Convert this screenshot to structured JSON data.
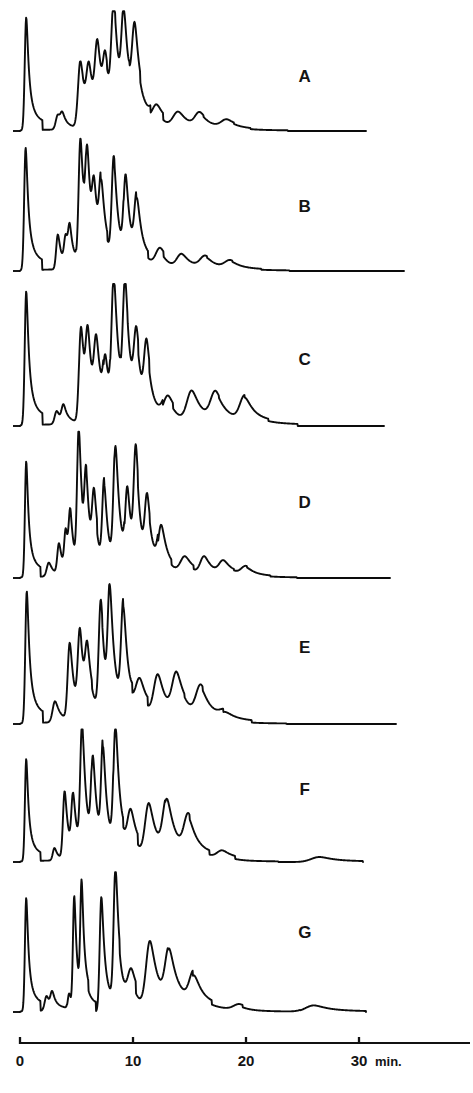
{
  "figure": {
    "background_color": "#ffffff",
    "trace_color": "#0c0c0c",
    "axis_color": "#111111"
  },
  "axis": {
    "label": "min.",
    "tick_labels": [
      "0",
      "10",
      "20",
      "30"
    ],
    "tick_values": [
      0,
      10,
      20,
      30
    ],
    "x_start_px": 20,
    "x_per_min_px": 11.3,
    "axis_y_px": 1043,
    "label_y_px": 1066
  },
  "panels": [
    {
      "label": "A",
      "label_x": 305,
      "label_y": 82,
      "baseline_y": 131,
      "top_y": 18,
      "end_x": 366
    },
    {
      "label": "B",
      "label_x": 305,
      "label_y": 212,
      "baseline_y": 271,
      "top_y": 146,
      "end_x": 404
    },
    {
      "label": "C",
      "label_x": 305,
      "label_y": 365,
      "baseline_y": 426,
      "top_y": 292,
      "end_x": 384
    },
    {
      "label": "D",
      "label_x": 305,
      "label_y": 508,
      "baseline_y": 578,
      "top_y": 440,
      "end_x": 390
    },
    {
      "label": "E",
      "label_x": 305,
      "label_y": 653,
      "baseline_y": 724,
      "top_y": 592,
      "end_x": 396
    },
    {
      "label": "F",
      "label_x": 305,
      "label_y": 795,
      "baseline_y": 862,
      "top_y": 737,
      "end_x": 363
    },
    {
      "label": "G",
      "label_x": 305,
      "label_y": 938,
      "baseline_y": 1012,
      "top_y": 880,
      "end_x": 366
    }
  ],
  "chart_data": {
    "type": "line",
    "xlabel": "min.",
    "ylabel": "Detector response",
    "xlim": [
      0,
      34
    ],
    "ylim": [
      0,
      1
    ],
    "grid": false,
    "legend": "none",
    "x_ticks": [
      0,
      10,
      20,
      30
    ],
    "x_tick_labels": [
      "0",
      "10",
      "20",
      "30"
    ],
    "note": "Seven stacked chromatogram traces, each a solvent front peak near t=0 followed by a resolved peak series and a flat tail. Peak values are normalized 0-1 relative to each panel's own full height.",
    "series": [
      {
        "name": "A",
        "peaks": [
          {
            "t": 0.55,
            "h": 1.0,
            "w": 0.16
          },
          {
            "t": 3.35,
            "h": 0.13,
            "w": 0.22
          },
          {
            "t": 3.75,
            "h": 0.1,
            "w": 0.2
          },
          {
            "t": 5.35,
            "h": 0.6,
            "w": 0.26
          },
          {
            "t": 6.1,
            "h": 0.43,
            "w": 0.26
          },
          {
            "t": 6.85,
            "h": 0.6,
            "w": 0.26
          },
          {
            "t": 7.55,
            "h": 0.4,
            "w": 0.24
          },
          {
            "t": 8.3,
            "h": 0.93,
            "w": 0.26
          },
          {
            "t": 9.2,
            "h": 0.8,
            "w": 0.26
          },
          {
            "t": 10.15,
            "h": 0.68,
            "w": 0.28
          },
          {
            "t": 12.1,
            "h": 0.16,
            "w": 0.46
          },
          {
            "t": 14.0,
            "h": 0.14,
            "w": 0.55
          },
          {
            "t": 15.9,
            "h": 0.12,
            "w": 0.5
          },
          {
            "t": 18.3,
            "h": 0.07,
            "w": 0.6
          }
        ]
      },
      {
        "name": "B",
        "peaks": [
          {
            "t": 0.5,
            "h": 0.98,
            "w": 0.16
          },
          {
            "t": 3.35,
            "h": 0.28,
            "w": 0.18
          },
          {
            "t": 4.05,
            "h": 0.22,
            "w": 0.18
          },
          {
            "t": 4.4,
            "h": 0.24,
            "w": 0.16
          },
          {
            "t": 5.35,
            "h": 1.0,
            "w": 0.2
          },
          {
            "t": 5.95,
            "h": 0.72,
            "w": 0.2
          },
          {
            "t": 6.55,
            "h": 0.42,
            "w": 0.2
          },
          {
            "t": 7.2,
            "h": 0.53,
            "w": 0.22
          },
          {
            "t": 8.3,
            "h": 0.8,
            "w": 0.22
          },
          {
            "t": 9.35,
            "h": 0.64,
            "w": 0.22
          },
          {
            "t": 10.35,
            "h": 0.47,
            "w": 0.26
          },
          {
            "t": 12.4,
            "h": 0.14,
            "w": 0.46
          },
          {
            "t": 14.3,
            "h": 0.11,
            "w": 0.5
          },
          {
            "t": 16.4,
            "h": 0.09,
            "w": 0.55
          },
          {
            "t": 18.6,
            "h": 0.06,
            "w": 0.58
          }
        ]
      },
      {
        "name": "C",
        "peaks": [
          {
            "t": 0.55,
            "h": 1.0,
            "w": 0.16
          },
          {
            "t": 3.25,
            "h": 0.1,
            "w": 0.22
          },
          {
            "t": 3.85,
            "h": 0.12,
            "w": 0.2
          },
          {
            "t": 5.4,
            "h": 0.72,
            "w": 0.22
          },
          {
            "t": 6.0,
            "h": 0.52,
            "w": 0.22
          },
          {
            "t": 6.75,
            "h": 0.46,
            "w": 0.24
          },
          {
            "t": 7.55,
            "h": 0.36,
            "w": 0.22
          },
          {
            "t": 8.3,
            "h": 0.98,
            "w": 0.24
          },
          {
            "t": 9.3,
            "h": 0.88,
            "w": 0.24
          },
          {
            "t": 10.3,
            "h": 0.48,
            "w": 0.26
          },
          {
            "t": 11.2,
            "h": 0.45,
            "w": 0.26
          },
          {
            "t": 13.1,
            "h": 0.18,
            "w": 0.5
          },
          {
            "t": 15.2,
            "h": 0.23,
            "w": 0.52
          },
          {
            "t": 17.3,
            "h": 0.2,
            "w": 0.52
          },
          {
            "t": 19.9,
            "h": 0.18,
            "w": 0.52
          }
        ]
      },
      {
        "name": "D",
        "peaks": [
          {
            "t": 0.55,
            "h": 0.84,
            "w": 0.14
          },
          {
            "t": 2.55,
            "h": 0.1,
            "w": 0.22
          },
          {
            "t": 3.45,
            "h": 0.22,
            "w": 0.18
          },
          {
            "t": 4.05,
            "h": 0.28,
            "w": 0.16
          },
          {
            "t": 4.45,
            "h": 0.36,
            "w": 0.16
          },
          {
            "t": 5.2,
            "h": 1.0,
            "w": 0.18
          },
          {
            "t": 5.85,
            "h": 0.55,
            "w": 0.18
          },
          {
            "t": 6.55,
            "h": 0.43,
            "w": 0.2
          },
          {
            "t": 7.45,
            "h": 0.6,
            "w": 0.2
          },
          {
            "t": 8.45,
            "h": 0.86,
            "w": 0.22
          },
          {
            "t": 9.5,
            "h": 0.52,
            "w": 0.22
          },
          {
            "t": 10.25,
            "h": 0.76,
            "w": 0.22
          },
          {
            "t": 11.25,
            "h": 0.43,
            "w": 0.24
          },
          {
            "t": 12.5,
            "h": 0.32,
            "w": 0.32
          },
          {
            "t": 14.6,
            "h": 0.12,
            "w": 0.48
          },
          {
            "t": 16.3,
            "h": 0.13,
            "w": 0.42
          },
          {
            "t": 18.0,
            "h": 0.09,
            "w": 0.46
          },
          {
            "t": 20.0,
            "h": 0.06,
            "w": 0.5
          }
        ]
      },
      {
        "name": "E",
        "peaks": [
          {
            "t": 0.6,
            "h": 1.0,
            "w": 0.16
          },
          {
            "t": 3.1,
            "h": 0.16,
            "w": 0.26
          },
          {
            "t": 4.4,
            "h": 0.58,
            "w": 0.22
          },
          {
            "t": 5.3,
            "h": 0.59,
            "w": 0.22
          },
          {
            "t": 5.95,
            "h": 0.39,
            "w": 0.22
          },
          {
            "t": 7.15,
            "h": 0.83,
            "w": 0.22
          },
          {
            "t": 7.95,
            "h": 0.86,
            "w": 0.22
          },
          {
            "t": 9.15,
            "h": 0.76,
            "w": 0.24
          },
          {
            "t": 10.6,
            "h": 0.25,
            "w": 0.44
          },
          {
            "t": 12.2,
            "h": 0.32,
            "w": 0.44
          },
          {
            "t": 13.85,
            "h": 0.3,
            "w": 0.46
          },
          {
            "t": 16.0,
            "h": 0.22,
            "w": 0.5
          },
          {
            "t": 18.2,
            "h": 0.05,
            "w": 0.6
          }
        ]
      },
      {
        "name": "F",
        "peaks": [
          {
            "t": 0.55,
            "h": 0.82,
            "w": 0.14
          },
          {
            "t": 3.05,
            "h": 0.1,
            "w": 0.18
          },
          {
            "t": 3.95,
            "h": 0.54,
            "w": 0.18
          },
          {
            "t": 4.7,
            "h": 0.44,
            "w": 0.18
          },
          {
            "t": 5.5,
            "h": 1.0,
            "w": 0.2
          },
          {
            "t": 6.45,
            "h": 0.68,
            "w": 0.2
          },
          {
            "t": 7.35,
            "h": 0.8,
            "w": 0.2
          },
          {
            "t": 8.45,
            "h": 0.98,
            "w": 0.22
          },
          {
            "t": 9.8,
            "h": 0.3,
            "w": 0.34
          },
          {
            "t": 11.4,
            "h": 0.42,
            "w": 0.4
          },
          {
            "t": 13.0,
            "h": 0.42,
            "w": 0.42
          },
          {
            "t": 14.9,
            "h": 0.28,
            "w": 0.46
          },
          {
            "t": 17.9,
            "h": 0.06,
            "w": 0.55
          },
          {
            "t": 26.5,
            "h": 0.04,
            "w": 0.9
          }
        ]
      },
      {
        "name": "G",
        "peaks": [
          {
            "t": 0.55,
            "h": 0.86,
            "w": 0.14
          },
          {
            "t": 2.35,
            "h": 0.11,
            "w": 0.2
          },
          {
            "t": 2.85,
            "h": 0.11,
            "w": 0.18
          },
          {
            "t": 4.35,
            "h": 0.12,
            "w": 0.14
          },
          {
            "t": 4.8,
            "h": 0.84,
            "w": 0.14
          },
          {
            "t": 5.45,
            "h": 0.84,
            "w": 0.14
          },
          {
            "t": 7.2,
            "h": 0.87,
            "w": 0.18
          },
          {
            "t": 8.45,
            "h": 1.0,
            "w": 0.2
          },
          {
            "t": 9.85,
            "h": 0.22,
            "w": 0.36
          },
          {
            "t": 11.5,
            "h": 0.5,
            "w": 0.42
          },
          {
            "t": 13.2,
            "h": 0.38,
            "w": 0.42
          },
          {
            "t": 15.4,
            "h": 0.22,
            "w": 0.48
          },
          {
            "t": 19.4,
            "h": 0.04,
            "w": 0.6
          },
          {
            "t": 26.0,
            "h": 0.05,
            "w": 0.9
          }
        ]
      }
    ]
  }
}
